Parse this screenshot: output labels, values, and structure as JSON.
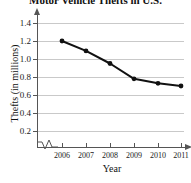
{
  "chart_data": {
    "type": "line",
    "title": "Motor Vehicle Thefts in U.S.",
    "xlabel": "Year",
    "ylabel": "Thefts (in millions)",
    "categories": [
      "2006",
      "2007",
      "2008",
      "2009",
      "2010",
      "2011"
    ],
    "x": [
      2006,
      2007,
      2008,
      2009,
      2010,
      2011
    ],
    "values": [
      1.2,
      1.09,
      0.95,
      0.78,
      0.73,
      0.7
    ],
    "series": [
      {
        "name": "Thefts",
        "values": [
          1.2,
          1.09,
          0.95,
          0.78,
          0.73,
          0.7
        ]
      }
    ],
    "ylim": [
      0.0,
      1.5
    ],
    "xlim": [
      2006,
      2011
    ],
    "y_ticks": [
      0.2,
      0.4,
      0.6,
      0.8,
      1.0,
      1.2,
      1.4
    ],
    "y_tick_labels": [
      "0.2",
      "0.4",
      "0.6",
      "0.8",
      "1.0",
      "1.2",
      "1.4"
    ],
    "x_ticks": [
      2006,
      2007,
      2008,
      2009,
      2010,
      2011
    ],
    "x_tick_labels": [
      "2006",
      "2007",
      "2008",
      "2009",
      "2010",
      "2011"
    ],
    "grid": "horizontal",
    "legend": "none",
    "axis_break": "x-axis between origin and 2006",
    "marker": "filled-circle",
    "line_color": "#111111",
    "marker_color": "#111111",
    "grid_color": "#c9c9c9",
    "axis_color": "#555555",
    "background_color": "#ffffff"
  },
  "labels": {
    "y_0": "0.2",
    "y_1": "0.4",
    "y_2": "0.6",
    "y_3": "0.8",
    "y_4": "1.0",
    "y_5": "1.2",
    "y_6": "1.4",
    "x_0": "2006",
    "x_1": "2007",
    "x_2": "2008",
    "x_3": "2009",
    "x_4": "2010",
    "x_5": "2011"
  }
}
